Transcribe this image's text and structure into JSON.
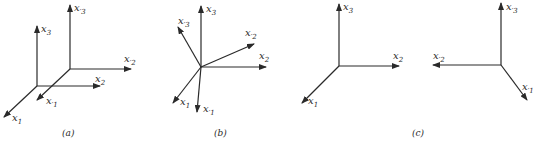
{
  "figure": {
    "panels": [
      {
        "id": "a",
        "caption": "(a)",
        "description": "Translated coordinate frame",
        "axes": [
          {
            "label": "x",
            "sub": "1",
            "prime": false
          },
          {
            "label": "x",
            "sub": "2",
            "prime": false
          },
          {
            "label": "x",
            "sub": "3",
            "prime": false
          },
          {
            "label": "x",
            "sub": "1",
            "prime": true
          },
          {
            "label": "x",
            "sub": "2",
            "prime": true
          },
          {
            "label": "x",
            "sub": "3",
            "prime": true
          }
        ]
      },
      {
        "id": "b",
        "caption": "(b)",
        "description": "Rotated coordinate frame",
        "axes": [
          {
            "label": "x",
            "sub": "1",
            "prime": false
          },
          {
            "label": "x",
            "sub": "2",
            "prime": false
          },
          {
            "label": "x",
            "sub": "3",
            "prime": false
          },
          {
            "label": "x",
            "sub": "1",
            "prime": true
          },
          {
            "label": "x",
            "sub": "2",
            "prime": true
          },
          {
            "label": "x",
            "sub": "3",
            "prime": true
          }
        ]
      },
      {
        "id": "c",
        "caption": "(c)",
        "description": "Reflected coordinate frame",
        "axes": [
          {
            "label": "x",
            "sub": "1",
            "prime": false
          },
          {
            "label": "x",
            "sub": "2",
            "prime": false
          },
          {
            "label": "x",
            "sub": "3",
            "prime": false
          },
          {
            "label": "x",
            "sub": "1",
            "prime": true
          },
          {
            "label": "x",
            "sub": "2",
            "prime": true
          },
          {
            "label": "x",
            "sub": "3",
            "prime": true
          }
        ]
      }
    ]
  },
  "labels": {
    "x1": "x",
    "x2": "x",
    "x3": "x",
    "s1": "1",
    "s2": "2",
    "s3": "3",
    "s1p": "′1",
    "s2p": "′2",
    "s3p": "′3",
    "cap_a": "(a)",
    "cap_b": "(b)",
    "cap_c": "(c)"
  }
}
